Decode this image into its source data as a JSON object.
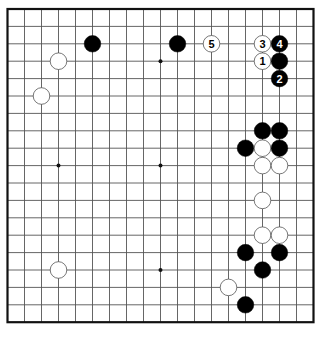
{
  "board": {
    "size": 19,
    "origin_x": 7.5,
    "origin_y": 9,
    "spacing_x": 17,
    "spacing_y": 17.4,
    "line_color": "#555555",
    "border_color": "#111111",
    "background": "#ffffff",
    "star_points": [
      [
        3,
        3
      ],
      [
        9,
        3
      ],
      [
        15,
        3
      ],
      [
        3,
        9
      ],
      [
        9,
        9
      ],
      [
        15,
        9
      ],
      [
        3,
        15
      ],
      [
        9,
        15
      ],
      [
        15,
        15
      ]
    ]
  },
  "stones": [
    {
      "color": "black",
      "col": 5,
      "row": 2,
      "label": ""
    },
    {
      "color": "black",
      "col": 10,
      "row": 2,
      "label": ""
    },
    {
      "color": "white",
      "col": 12,
      "row": 2,
      "label": "5"
    },
    {
      "color": "white",
      "col": 15,
      "row": 2,
      "label": "3"
    },
    {
      "color": "black",
      "col": 16,
      "row": 2,
      "label": "4"
    },
    {
      "color": "white",
      "col": 15,
      "row": 3,
      "label": "1"
    },
    {
      "color": "black",
      "col": 16,
      "row": 3,
      "label": ""
    },
    {
      "color": "black",
      "col": 16,
      "row": 4,
      "label": "2"
    },
    {
      "color": "white",
      "col": 3,
      "row": 3,
      "label": ""
    },
    {
      "color": "white",
      "col": 2,
      "row": 5,
      "label": ""
    },
    {
      "color": "black",
      "col": 15,
      "row": 7,
      "label": ""
    },
    {
      "color": "black",
      "col": 16,
      "row": 7,
      "label": ""
    },
    {
      "color": "black",
      "col": 14,
      "row": 8,
      "label": ""
    },
    {
      "color": "white",
      "col": 15,
      "row": 8,
      "label": ""
    },
    {
      "color": "black",
      "col": 16,
      "row": 8,
      "label": ""
    },
    {
      "color": "white",
      "col": 15,
      "row": 9,
      "label": ""
    },
    {
      "color": "white",
      "col": 16,
      "row": 9,
      "label": ""
    },
    {
      "color": "white",
      "col": 15,
      "row": 11,
      "label": ""
    },
    {
      "color": "white",
      "col": 15,
      "row": 13,
      "label": ""
    },
    {
      "color": "white",
      "col": 16,
      "row": 13,
      "label": ""
    },
    {
      "color": "black",
      "col": 14,
      "row": 14,
      "label": ""
    },
    {
      "color": "black",
      "col": 16,
      "row": 14,
      "label": ""
    },
    {
      "color": "black",
      "col": 15,
      "row": 15,
      "label": ""
    },
    {
      "color": "white",
      "col": 13,
      "row": 16,
      "label": ""
    },
    {
      "color": "black",
      "col": 14,
      "row": 17,
      "label": ""
    },
    {
      "color": "white",
      "col": 3,
      "row": 15,
      "label": ""
    }
  ]
}
